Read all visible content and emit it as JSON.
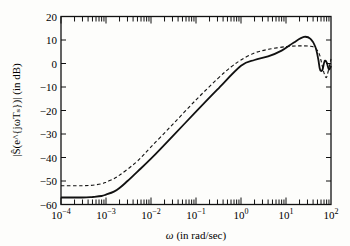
{
  "chart_data": {
    "type": "line",
    "title": "",
    "xlabel": "ω (in rad/sec)",
    "ylabel": "|Ŝ(e^{jωT_s})| (in dB)",
    "xscale": "log",
    "xlim": [
      0.0001,
      100
    ],
    "ylim": [
      -60,
      20
    ],
    "x_ticks": [
      "10^-4",
      "10^-3",
      "10^-2",
      "10^-1",
      "10^0",
      "10^1",
      "10^2"
    ],
    "y_ticks": [
      20,
      10,
      0,
      -10,
      -20,
      -30,
      -40,
      -50,
      -60
    ],
    "grid": false,
    "legend": null,
    "series": [
      {
        "name": "solid",
        "style": "solid",
        "x": [
          0.0001,
          0.0003,
          0.0005,
          0.0008,
          0.001,
          0.0015,
          0.002,
          0.003,
          0.005,
          0.01,
          0.03,
          0.1,
          0.3,
          1,
          2,
          4,
          8,
          15,
          25,
          35,
          45,
          52,
          56,
          60,
          65,
          72,
          80,
          90,
          100
        ],
        "y": [
          -57,
          -57,
          -56.8,
          -56.4,
          -55.8,
          -54.5,
          -53,
          -50,
          -46,
          -40.5,
          -31,
          -20.5,
          -11,
          -1,
          1.5,
          3,
          5.5,
          9,
          11.3,
          10.5,
          7,
          2,
          -2,
          -3.2,
          -2.5,
          1,
          0.5,
          -2.5,
          -1
        ]
      },
      {
        "name": "dashed",
        "style": "dashed",
        "x": [
          0.0001,
          0.0003,
          0.0005,
          0.0008,
          0.001,
          0.0015,
          0.002,
          0.003,
          0.005,
          0.01,
          0.03,
          0.1,
          0.3,
          0.6,
          1,
          2,
          4,
          10,
          20,
          35,
          45,
          55,
          62,
          70,
          78,
          85,
          100
        ],
        "y": [
          -52,
          -52,
          -51.8,
          -51.2,
          -50.5,
          -49,
          -47.5,
          -45,
          -41.5,
          -35.5,
          -26,
          -15.5,
          -6.5,
          -1.5,
          1.5,
          4.5,
          6,
          7.2,
          7.5,
          7.3,
          6.5,
          4,
          0,
          -4,
          -6,
          -4,
          2
        ]
      }
    ]
  },
  "axes": {
    "x_tick_labels": [
      {
        "base": "10",
        "exp": "−4"
      },
      {
        "base": "10",
        "exp": "−3"
      },
      {
        "base": "10",
        "exp": "−2"
      },
      {
        "base": "10",
        "exp": "−1"
      },
      {
        "base": "10",
        "exp": "0"
      },
      {
        "base": "10",
        "exp": "1"
      },
      {
        "base": "10",
        "exp": "2"
      }
    ],
    "y_tick_labels": [
      "20",
      "10",
      "0",
      "−10",
      "−20",
      "−30",
      "−40",
      "−50",
      "−60"
    ],
    "xlabel_omega": "ω",
    "xlabel_rest": " (in rad/sec)",
    "ylabel_text": "|Ŝ(e^{jωTₛ})| (in dB)"
  }
}
